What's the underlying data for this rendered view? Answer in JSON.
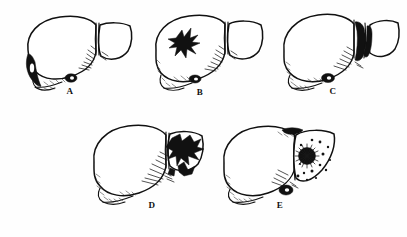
{
  "figure": {
    "medium": "black ink line drawing, scanned halftone",
    "background_color": "#fefefe",
    "ink_color": "#111111",
    "layout": "five panels, three in top row, two in bottom row",
    "panel_count": 5,
    "labels_visible": [
      "A",
      "B",
      "C",
      "D",
      "E"
    ]
  },
  "panels": [
    {
      "id": "panel-a",
      "label": "A",
      "subject": "liver",
      "row": 1,
      "column": 1,
      "description": "Intact liver viewed from the front; dark solid wedge of ink shading the inferior tip of the left lobe and a small dark oval gallbladder at the inferior border; fine hatching along the interlobar fissure.",
      "features": [
        "left-lobe-tip-dark-wedge",
        "gallbladder-dark-oval",
        "falciform-ligament-groove",
        "inferior-border-hatching"
      ]
    },
    {
      "id": "panel-b",
      "label": "B",
      "subject": "liver",
      "row": 1,
      "column": 2,
      "description": "Liver with an irregular jagged star-shaped solid black lesion in the upper portion of the left lobe; gallbladder shown dark at the inferior margin.",
      "features": [
        "stellate-black-lesion-left-lobe",
        "gallbladder-dark-oval",
        "interlobar-hatching"
      ]
    },
    {
      "id": "panel-c",
      "label": "C",
      "subject": "liver",
      "row": 1,
      "column": 3,
      "description": "Liver with a deep dark V-shaped laceration splitting the right lobe away at the interlobar fissure; heavy black ink fills the cleft and the lobe edges are separated.",
      "features": [
        "deep-interlobar-laceration",
        "separated-right-lobe",
        "gallbladder-dark-oval",
        "left-lobe-tip-hatching"
      ]
    },
    {
      "id": "panel-d",
      "label": "D",
      "subject": "liver",
      "row": 2,
      "column": 1,
      "description": "Liver with the right lobe shattered into jagged black fragments; dense burst pattern of ink with fine radiating hatching across the fracture zone.",
      "features": [
        "shattered-right-lobe",
        "jagged-black-fragments",
        "radiating-fracture-hatching",
        "intact-left-lobe"
      ]
    },
    {
      "id": "panel-e",
      "label": "E",
      "subject": "liver",
      "row": 2,
      "column": 2,
      "description": "Liver with a dense round stellate black lesion in the right lobe surrounded by scattered small satellite dots; dark shading along the superior border and a dark gallbladder at the inferior margin.",
      "features": [
        "central-stellate-lesion-right-lobe",
        "scattered-satellite-dots",
        "superior-border-dark-shading",
        "gallbladder-dark-oval",
        "left-lobe-tip-hatching"
      ]
    }
  ]
}
